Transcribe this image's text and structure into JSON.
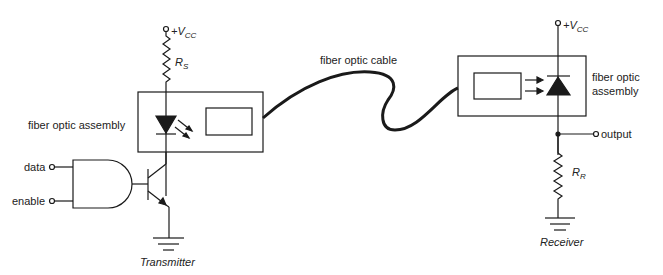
{
  "diagram": {
    "type": "circuit",
    "transmitter": {
      "caption": "Transmitter",
      "supply_label": "+V",
      "supply_sub": "CC",
      "resistor_label": "R",
      "resistor_sub": "S",
      "assembly_label": "fiber optic assembly",
      "inputs": [
        "data",
        "enable"
      ],
      "components": [
        "AND gate",
        "NPN transistor",
        "LED",
        "resistor R_S",
        "ground"
      ]
    },
    "cable": {
      "label": "fiber optic cable"
    },
    "receiver": {
      "caption": "Receiver",
      "supply_label": "+V",
      "supply_sub": "CC",
      "resistor_label": "R",
      "resistor_sub": "R",
      "assembly_label_line1": "fiber optic",
      "assembly_label_line2": "assembly",
      "output_label": "output",
      "components": [
        "photodiode",
        "resistor R_R",
        "ground"
      ]
    },
    "colors": {
      "line": "#1a1a1a",
      "background": "#ffffff"
    }
  }
}
